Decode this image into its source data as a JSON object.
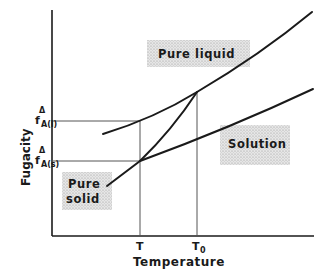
{
  "diagram": {
    "type": "fugacity-temperature phase diagram",
    "axes": {
      "x_label": "Temperature",
      "y_label": "Fugacity",
      "x_ticks": [
        {
          "label": "T",
          "sub": "",
          "x": 140
        },
        {
          "label": "T",
          "sub": "0",
          "x": 197
        }
      ],
      "y_ticks": [
        {
          "label": "f",
          "sup": "Δ",
          "sub": "A(l)",
          "y": 121
        },
        {
          "label": "f",
          "sup": "Δ",
          "sub": "A(s)",
          "y": 161
        }
      ]
    },
    "curves": [
      {
        "name": "Pure liquid",
        "points": [
          [
            103,
            134
          ],
          [
            140,
            121
          ],
          [
            197,
            92
          ],
          [
            260,
            57
          ],
          [
            312,
            12
          ]
        ]
      },
      {
        "name": "Solution",
        "points": [
          [
            140,
            161
          ],
          [
            197,
            138
          ],
          [
            260,
            113
          ],
          [
            313,
            89
          ]
        ]
      },
      {
        "name": "Pure solid",
        "points": [
          [
            107,
            186
          ],
          [
            140,
            161
          ],
          [
            170,
            128
          ],
          [
            197,
            92
          ]
        ]
      }
    ],
    "labels": {
      "pure_liquid": "Pure liquid",
      "solution": "Solution",
      "pure_solid_line1": "Pure",
      "pure_solid_line2": "solid"
    },
    "colors": {
      "line": "#1a1a1a",
      "guide": "#555555",
      "box_fill": "#d9d9d9"
    }
  }
}
